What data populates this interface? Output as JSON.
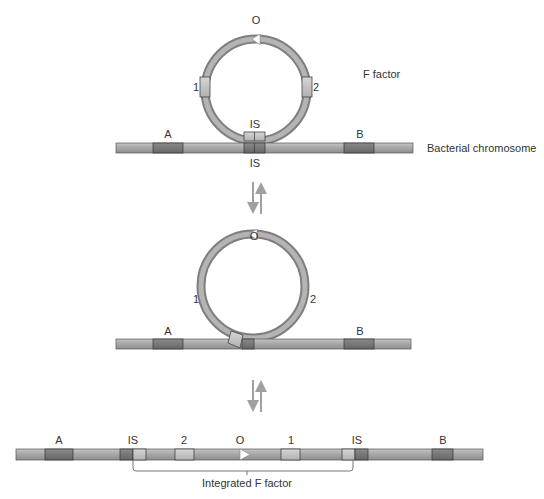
{
  "colors": {
    "strand": "#9c9c9c",
    "strand_light": "#bdbdbd",
    "strand_dark": "#7a7a7a",
    "gene_dark": "#6f6f6f",
    "gene_light": "#b8b8b8",
    "is_light": "#c8c8c8",
    "outline": "#333333",
    "arrow_grey": "#a0a0a0",
    "text": "#333333"
  },
  "panel1": {
    "plasmid_label": "F factor",
    "origin_label": "O",
    "segment_1_label": "1",
    "segment_2_label": "2",
    "plasmid_is_label": "IS",
    "chromosome_is_label": "IS",
    "gene_a_label": "A",
    "gene_b_label": "B",
    "chromosome_label": "Bacterial chromosome"
  },
  "panel2": {
    "origin_label": "O",
    "segment_1_label": "1",
    "segment_2_label": "2",
    "gene_a_label": "A",
    "gene_b_label": "B"
  },
  "panel3": {
    "gene_a_label": "A",
    "is_left_label": "IS",
    "segment_2_label": "2",
    "origin_label": "O",
    "segment_1_label": "1",
    "is_right_label": "IS",
    "gene_b_label": "B",
    "bracket_label": "Integrated F factor"
  },
  "arrows": {
    "step1": "reversible-arrows",
    "step2": "reversible-arrows"
  }
}
